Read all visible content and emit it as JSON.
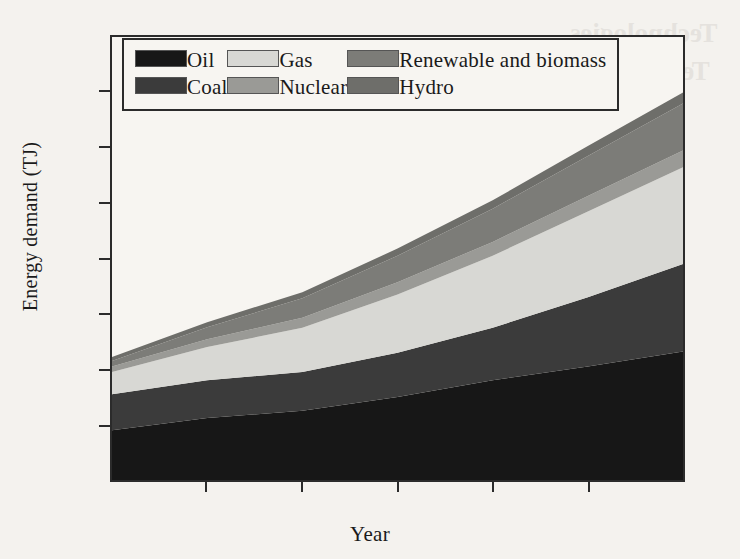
{
  "page": {
    "background_color": "#f4f2ee",
    "bleed_through_text": [
      "Technologies",
      "Technology Overview",
      "and Practices"
    ],
    "bleed_through_watermark": "Nuclear"
  },
  "chart_data": {
    "type": "area",
    "stacked": true,
    "title": "",
    "xlabel": "Year",
    "ylabel": "Energy demand (TJ)",
    "x": [
      1970,
      1980,
      1990,
      2000,
      2010,
      2020,
      2030
    ],
    "xlim": [
      1970,
      2030
    ],
    "ylim": [
      0,
      800
    ],
    "xticks": [
      1970,
      1980,
      1990,
      2000,
      2010,
      2020,
      2030
    ],
    "yticks": [
      0,
      100,
      200,
      300,
      400,
      500,
      600,
      700,
      800
    ],
    "xtick_labels": [
      "1970",
      "1980",
      "1990",
      "2000",
      "2010",
      "2020",
      "2030"
    ],
    "ytick_labels": [
      "0",
      "100",
      "200",
      "300",
      "400",
      "500",
      "600",
      "700",
      "800"
    ],
    "grid": false,
    "legend_position": "top-left-inside",
    "series": [
      {
        "name": "Oil",
        "color": "#171717",
        "values": [
          90,
          112,
          125,
          150,
          180,
          205,
          232
        ]
      },
      {
        "name": "Coal",
        "color": "#3b3b3b",
        "values": [
          65,
          68,
          70,
          80,
          95,
          125,
          158
        ]
      },
      {
        "name": "Gas",
        "color": "#d8d8d4",
        "values": [
          40,
          60,
          80,
          105,
          130,
          155,
          175
        ]
      },
      {
        "name": "Nuclear",
        "color": "#9a9a96",
        "values": [
          10,
          14,
          18,
          22,
          25,
          28,
          30
        ]
      },
      {
        "name": "Renewable and biomass",
        "color": "#7c7c78",
        "values": [
          10,
          22,
          35,
          48,
          60,
          72,
          85
        ]
      },
      {
        "name": "Hydro",
        "color": "#6e6e6a",
        "values": [
          7,
          9,
          11,
          13,
          15,
          18,
          20
        ]
      }
    ],
    "cumulative_top": {
      "Oil": [
        90,
        112,
        125,
        150,
        180,
        205,
        232
      ],
      "Coal": [
        155,
        180,
        195,
        230,
        275,
        330,
        390
      ],
      "Gas": [
        195,
        240,
        275,
        335,
        405,
        485,
        565
      ],
      "Nuclear": [
        205,
        254,
        293,
        357,
        430,
        513,
        595
      ],
      "Renewable and biomass": [
        215,
        276,
        328,
        405,
        490,
        585,
        680
      ],
      "Hydro": [
        222,
        285,
        339,
        418,
        505,
        603,
        700
      ]
    },
    "total": [
      222,
      285,
      339,
      418,
      505,
      603,
      700
    ]
  },
  "legend": {
    "rows": [
      [
        {
          "label": "Oil",
          "color": "#171717"
        },
        {
          "label": "Gas",
          "color": "#d8d8d4"
        },
        {
          "label": "Renewable and biomass",
          "color": "#7c7c78"
        }
      ],
      [
        {
          "label": "Coal",
          "color": "#3b3b3b"
        },
        {
          "label": "Nuclear",
          "color": "#9a9a96"
        },
        {
          "label": "Hydro",
          "color": "#6e6e6a"
        }
      ]
    ]
  }
}
